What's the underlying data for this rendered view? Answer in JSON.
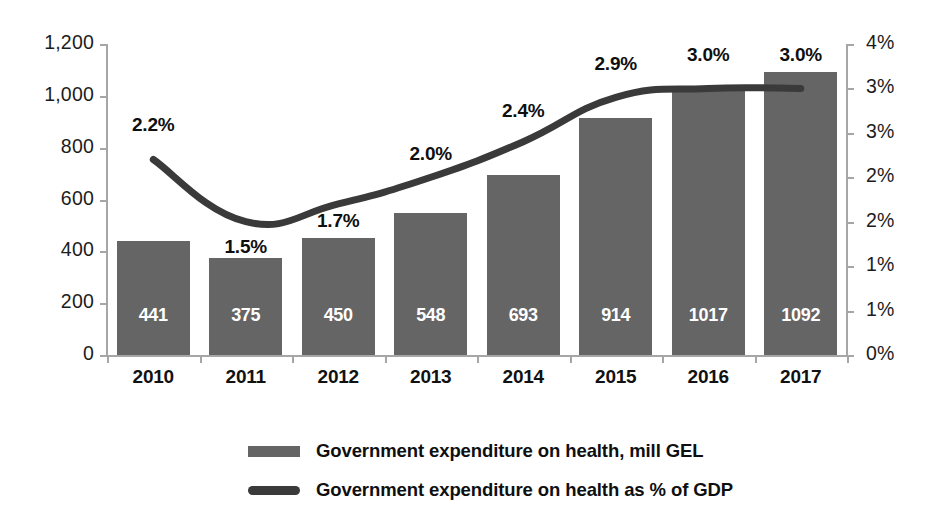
{
  "chart_data": {
    "type": "bar",
    "title": "",
    "subtitle": "",
    "xlabel": "",
    "ylabel": "",
    "categories": [
      "2010",
      "2011",
      "2012",
      "2013",
      "2014",
      "2015",
      "2016",
      "2017"
    ],
    "series": [
      {
        "name": "Government expenditure on health, mill GEL",
        "type": "bar",
        "axis": "left",
        "values": [
          441,
          375,
          450,
          548,
          693,
          914,
          1017,
          1092
        ],
        "labels": [
          "441",
          "375",
          "450",
          "548",
          "693",
          "914",
          "1017",
          "1092"
        ],
        "color": "#656565"
      },
      {
        "name": "Government expenditure on health as % of GDP",
        "type": "line",
        "axis": "right",
        "values": [
          2.2,
          1.5,
          1.7,
          2.0,
          2.4,
          2.9,
          3.0,
          3.0
        ],
        "labels": [
          "2.2%",
          "1.5%",
          "1.7%",
          "2.0%",
          "2.4%",
          "2.9%",
          "3.0%",
          "3.0%"
        ],
        "color": "#3a3a3a"
      }
    ],
    "left_axis": {
      "ticks": [
        "0",
        "200",
        "400",
        "600",
        "800",
        "1,000",
        "1,200"
      ],
      "values": [
        0,
        200,
        400,
        600,
        800,
        1000,
        1200
      ],
      "ylim": [
        0,
        1200
      ]
    },
    "right_axis": {
      "ticks": [
        "0%",
        "1%",
        "1%",
        "2%",
        "2%",
        "3%",
        "3%",
        "4%"
      ],
      "values": [
        0,
        0.5,
        1.0,
        1.5,
        2.0,
        2.5,
        3.0,
        3.5
      ],
      "ylim": [
        0,
        3.5
      ]
    },
    "grid": false,
    "legend_position": "bottom"
  },
  "legend": {
    "items": [
      {
        "label": "Government expenditure on health, mill GEL",
        "marker": "bar-swatch"
      },
      {
        "label": "Government expenditure on health as % of GDP",
        "marker": "line-swatch"
      }
    ]
  }
}
